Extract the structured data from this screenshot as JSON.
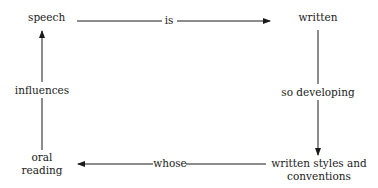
{
  "nodes": {
    "speech": "speech",
    "written": "written",
    "written_styles_line1": "written styles and",
    "written_styles_line2": "conventions",
    "oral_line1": "oral",
    "oral_line2": "reading"
  },
  "edges": {
    "top": "is",
    "right": "so developing",
    "bottom": "whose",
    "left": "influences"
  },
  "colors": {
    "line": "#1a1a1a",
    "background": "#ffffff"
  }
}
